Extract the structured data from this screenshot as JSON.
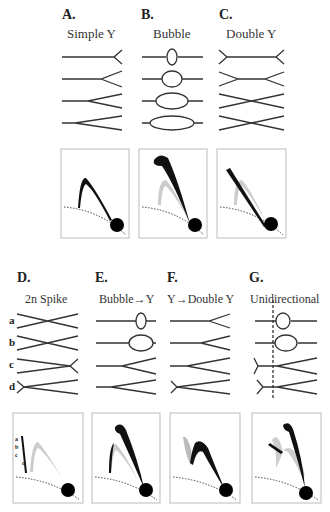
{
  "figure": {
    "panels": [
      {
        "id": "A",
        "letter": "A.",
        "title": "Simple Y"
      },
      {
        "id": "B",
        "letter": "B.",
        "title": "Bubble"
      },
      {
        "id": "C",
        "letter": "C.",
        "title": "Double Y"
      },
      {
        "id": "D",
        "letter": "D.",
        "title": "2n Spike",
        "row_labels": [
          "a",
          "b",
          "c",
          "d"
        ],
        "inset_labels": [
          "a",
          "b",
          "c",
          "d"
        ]
      },
      {
        "id": "E",
        "letter": "E.",
        "title": "Bubble→Y"
      },
      {
        "id": "F",
        "letter": "F.",
        "title": "Y→Double Y"
      },
      {
        "id": "G",
        "letter": "G.",
        "title": "Unidirectional"
      }
    ],
    "colors": {
      "line": "#333333",
      "trail_dark": "#111111",
      "trail_light": "#c8c8c8",
      "frame": "#bbbbbb",
      "body": "#000000"
    }
  }
}
